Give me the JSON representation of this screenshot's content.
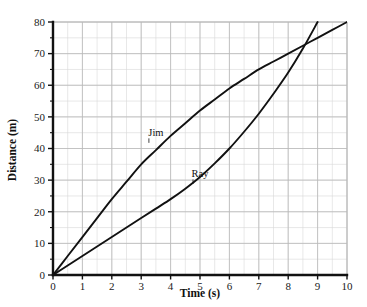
{
  "chart_data": {
    "type": "line",
    "title": "",
    "xlabel": "Time (s)",
    "ylabel": "Distance (m)",
    "xlim": [
      0,
      10
    ],
    "ylim": [
      0,
      80
    ],
    "xticks": [
      "0",
      "1",
      "2",
      "3",
      "4",
      "5",
      "6",
      "7",
      "8",
      "9",
      "10"
    ],
    "yticks": [
      "0",
      "10",
      "20",
      "30",
      "40",
      "50",
      "60",
      "70",
      "80"
    ],
    "x_minor_step": 0.5,
    "y_minor_step": 5,
    "grid": true,
    "grid_color": "#b9b9b9",
    "grid_minor_color": "#d9d9d9",
    "axis_color": "#111111",
    "line_color": "#111111",
    "background": "#ffffff",
    "legend": "inline-labels",
    "annotations": [
      {
        "text": "Jim",
        "x": 3.5,
        "y": 44
      },
      {
        "text": "Ray",
        "x": 5.0,
        "y": 31
      }
    ],
    "series": [
      {
        "name": "Jim",
        "shape": "concave-down",
        "x": [
          0,
          0.5,
          1,
          1.5,
          2,
          2.5,
          3,
          3.5,
          4,
          4.5,
          5,
          5.5,
          6,
          6.5,
          7,
          7.5,
          8,
          8.5,
          9,
          9.5,
          10
        ],
        "values": [
          0,
          6,
          12,
          18,
          24,
          29.5,
          35,
          39.5,
          44,
          48,
          52,
          55.5,
          59,
          62,
          65,
          67.5,
          70,
          72.5,
          75,
          77.5,
          80
        ]
      },
      {
        "name": "Ray",
        "shape": "concave-up",
        "x": [
          0,
          0.5,
          1,
          1.5,
          2,
          2.5,
          3,
          3.5,
          4,
          4.5,
          5,
          5.5,
          6,
          6.5,
          7,
          7.5,
          8,
          8.5,
          9
        ],
        "values": [
          0,
          3,
          6,
          9,
          12,
          15,
          18,
          21,
          24,
          27.3,
          31,
          35.3,
          40,
          45.3,
          51,
          57.3,
          64,
          71.6,
          80
        ]
      }
    ],
    "intersection": {
      "x": 8.4,
      "y": 71
    }
  },
  "plot_geometry": {
    "left": 53,
    "right": 347,
    "top": 22,
    "bottom": 275
  }
}
